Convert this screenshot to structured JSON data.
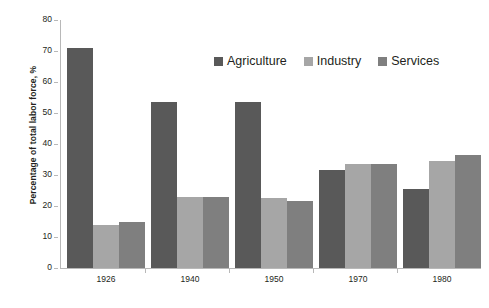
{
  "chart_data": {
    "type": "bar",
    "title": "",
    "xlabel": "",
    "ylabel": "Percentage of total labor force, %",
    "categories": [
      "1926",
      "1940",
      "1950",
      "1970",
      "1980"
    ],
    "series": [
      {
        "name": "Agriculture",
        "color": "#595959",
        "values": [
          71,
          53.5,
          53.5,
          31.5,
          25.5
        ]
      },
      {
        "name": "Industry",
        "color": "#a6a6a6",
        "values": [
          14,
          23,
          22.5,
          33.5,
          34.5
        ]
      },
      {
        "name": "Services",
        "color": "#7f7f7f",
        "values": [
          15,
          22.8,
          21.5,
          33.5,
          36.5
        ]
      }
    ],
    "ylim": [
      0,
      80
    ],
    "ytick_step": 10,
    "yticks": [
      "80",
      "70",
      "60",
      "50",
      "40",
      "30",
      "20",
      "10",
      "0"
    ],
    "grid": false,
    "legend_position": "top"
  }
}
